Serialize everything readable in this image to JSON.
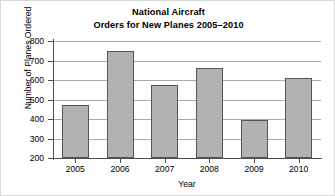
{
  "chart_data": {
    "type": "bar",
    "title": "National Aircraft Orders for New Planes 2005–2010",
    "title_lines": [
      "National Aircraft",
      "Orders for New Planes 2005–2010"
    ],
    "categories": [
      "2005",
      "2006",
      "2007",
      "2008",
      "2009",
      "2010"
    ],
    "values": [
      470,
      750,
      575,
      660,
      395,
      610
    ],
    "xlabel": "Year",
    "ylabel": "Number of Planes Ordered",
    "ylim": [
      200,
      800
    ],
    "ytick_values": [
      200,
      300,
      400,
      500,
      600,
      700,
      800
    ],
    "ytick_labels": [
      "200",
      "300",
      "400",
      "500",
      "600",
      "700",
      "800"
    ],
    "grid": true,
    "legend": false,
    "bar_color": "#b2b2b2",
    "bar_border_color": "#555555",
    "grid_color": "#a9a9a9",
    "axis_color": "#4d4d4d"
  }
}
